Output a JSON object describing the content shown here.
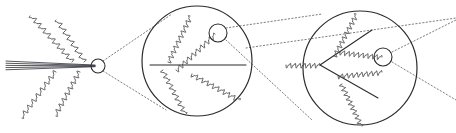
{
  "figure": {
    "name": "parton-shower-magnification-diagram",
    "title": "",
    "caption": "",
    "width": 456,
    "height": 133,
    "background_color": "#ffffff",
    "stroke_color": "#2b2b2b",
    "gluon_color": "#4a4a4a",
    "beam_color": "#3a3a44",
    "dotted_color": "#6e6e6e"
  },
  "stage_1": {
    "label": "",
    "beam": {
      "name": "collimated-jet-beam",
      "line_count": 5,
      "x_start": 6,
      "x_end": 95,
      "y_center": 66
    },
    "focus_circle": {
      "cx": 98,
      "cy": 66,
      "r": 7
    },
    "gluons": [
      {
        "name": "gluon-upper-left",
        "x1": 72,
        "y1": 62,
        "x2": 30,
        "y2": 16,
        "coils": 9
      },
      {
        "name": "gluon-upper-mid",
        "x1": 84,
        "y1": 62,
        "x2": 56,
        "y2": 20,
        "coils": 7
      },
      {
        "name": "gluon-lower-left",
        "x1": 56,
        "y1": 72,
        "x2": 22,
        "y2": 118,
        "coils": 8
      },
      {
        "name": "gluon-lower-mid",
        "x1": 80,
        "y1": 72,
        "x2": 56,
        "y2": 116,
        "coils": 8
      }
    ]
  },
  "stage_2": {
    "label": "",
    "circle": {
      "cx": 197,
      "cy": 61,
      "r": 55
    },
    "focus_circle": {
      "cx": 218,
      "cy": 33,
      "r": 9
    },
    "horizontal_line": {
      "x1": 150,
      "y1": 65,
      "x2": 246,
      "y2": 65
    },
    "gluons": [
      {
        "name": "gluon-stage2-up-left",
        "x1": 168,
        "y1": 62,
        "x2": 190,
        "y2": 16,
        "coils": 9
      },
      {
        "name": "gluon-stage2-up-right",
        "x1": 176,
        "y1": 70,
        "x2": 215,
        "y2": 34,
        "coils": 9
      },
      {
        "name": "gluon-stage2-down-left",
        "x1": 163,
        "y1": 70,
        "x2": 186,
        "y2": 114,
        "coils": 8
      },
      {
        "name": "gluon-stage2-down-right",
        "x1": 192,
        "y1": 74,
        "x2": 240,
        "y2": 100,
        "coils": 9
      }
    ]
  },
  "stage_3": {
    "label": "",
    "circle": {
      "cx": 360,
      "cy": 68,
      "r": 57
    },
    "focus_circle": {
      "cx": 383,
      "cy": 57,
      "r": 9
    },
    "vertex": {
      "x": 320,
      "y": 65
    },
    "incoming_gluon": {
      "name": "gluon-incoming-horizontal",
      "x1": 286,
      "y1": 65,
      "x2": 320,
      "y2": 65,
      "coils": 7
    },
    "quark_lines": [
      {
        "name": "quark-line-upper",
        "x1": 320,
        "y1": 65,
        "x2": 372,
        "y2": 30
      },
      {
        "name": "quark-line-lower",
        "x1": 320,
        "y1": 65,
        "x2": 378,
        "y2": 98
      }
    ],
    "gluons": [
      {
        "name": "gluon-stage3-up",
        "x1": 334,
        "y1": 56,
        "x2": 356,
        "y2": 14,
        "coils": 9
      },
      {
        "name": "gluon-stage3-up-right",
        "x1": 340,
        "y1": 52,
        "x2": 382,
        "y2": 57,
        "coils": 9
      },
      {
        "name": "gluon-stage3-mid-right",
        "x1": 338,
        "y1": 76,
        "x2": 382,
        "y2": 72,
        "coils": 9
      },
      {
        "name": "gluon-stage3-down",
        "x1": 342,
        "y1": 84,
        "x2": 362,
        "y2": 126,
        "coils": 9
      }
    ]
  },
  "connectors": {
    "name": "magnification-guides",
    "style": "dotted",
    "lines": [
      {
        "name": "guide-1-upper",
        "x1": 103,
        "y1": 61,
        "x2": 172,
        "y2": 14
      },
      {
        "name": "guide-1-lower",
        "x1": 103,
        "y1": 71,
        "x2": 166,
        "y2": 110
      },
      {
        "name": "guide-2-upper",
        "x1": 226,
        "y1": 28,
        "x2": 322,
        "y2": 14
      },
      {
        "name": "guide-2-lower",
        "x1": 226,
        "y1": 40,
        "x2": 312,
        "y2": 120
      },
      {
        "name": "guide-3-upper",
        "x1": 392,
        "y1": 52,
        "x2": 456,
        "y2": 20
      },
      {
        "name": "guide-3-lower",
        "x1": 392,
        "y1": 62,
        "x2": 456,
        "y2": 100
      },
      {
        "name": "guide-3-through",
        "x1": 246,
        "y1": 48,
        "x2": 456,
        "y2": 18
      }
    ]
  }
}
